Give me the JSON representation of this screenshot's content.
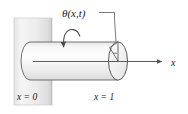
{
  "figure": {
    "background_color": "#ffffff",
    "width": 188,
    "height": 114
  },
  "labels": {
    "angle": "θ(x,t)",
    "fixed_end": "x = 0",
    "free_end": "x = 1",
    "axis": "x"
  },
  "colors": {
    "stroke": "#4a4a4a",
    "line": "#555555",
    "wall_light": "#f2f2f2",
    "wall_mid": "#dcdcdc",
    "wall_dark": "#c9c9c9",
    "cylinder_light": "#fbfbfb",
    "cylinder_mid": "#eeeeee",
    "cylinder_shadow": "#dadada",
    "text": "#1a1a1a"
  },
  "elements": {
    "wall_name": "fixed-support-wall",
    "cylinder_name": "shaft-cylinder",
    "end_cap_name": "free-end-cross-section",
    "twist_arrow_name": "torsion-rotation-arrow",
    "axis_arrow_name": "x-axis-arrow",
    "leader_name": "angle-leader-line",
    "wedge_name": "twist-angle-wedge"
  },
  "geometry": {
    "wall": {
      "x": 14,
      "y": 18,
      "width": 38,
      "height": 87
    },
    "cylinder": {
      "left": 30,
      "right": 118,
      "top": 42,
      "bottom": 80,
      "cap_rx": 9,
      "cap_ry": 19
    },
    "axis_line": {
      "x1": 33,
      "y1": 62,
      "x2": 163,
      "y2": 62
    },
    "axis_label_pos": {
      "x": 172,
      "y": 66
    },
    "theta_label_pos": {
      "x": 62,
      "y": 18
    },
    "fixed_label_pos": {
      "x": 17,
      "y": 100
    },
    "free_label_pos": {
      "x": 94,
      "y": 100
    }
  }
}
